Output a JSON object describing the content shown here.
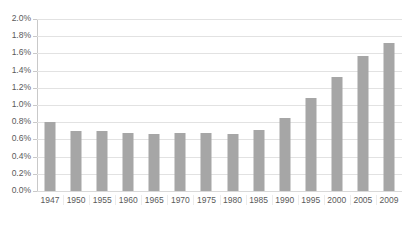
{
  "chart_data": {
    "type": "bar",
    "title": "",
    "subtitle": "",
    "xlabel": "",
    "ylabel": "",
    "ylim": [
      0,
      2.0
    ],
    "ytick_format": "percent",
    "grid": true,
    "legend": false,
    "bar_color": "#a6a6a6",
    "gridline_color": "#e2e2e2",
    "axis_color": "#c9c9c9",
    "label_color": "#5a5a5a",
    "background": "#ffffff",
    "categories": [
      "1947",
      "1950",
      "1955",
      "1960",
      "1965",
      "1970",
      "1975",
      "1980",
      "1985",
      "1990",
      "1995",
      "2000",
      "2005",
      "2009"
    ],
    "values": [
      0.8,
      0.7,
      0.7,
      0.68,
      0.66,
      0.67,
      0.67,
      0.66,
      0.71,
      0.85,
      1.08,
      1.32,
      1.57,
      1.72
    ],
    "yticks": [
      0.0,
      0.2,
      0.4,
      0.6,
      0.8,
      1.0,
      1.2,
      1.4,
      1.6,
      1.8,
      2.0
    ],
    "ytick_labels": [
      "0.0%",
      "0.2%",
      "0.4%",
      "0.6%",
      "0.8%",
      "1.0%",
      "1.2%",
      "1.4%",
      "1.6%",
      "1.8%",
      "2.0%"
    ]
  }
}
